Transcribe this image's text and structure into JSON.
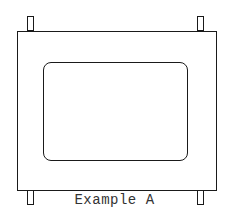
{
  "figure": {
    "caption": "Example A",
    "components": {
      "outer_frame": "rectangular frame",
      "inner_window": "rounded rectangle opening",
      "pins": [
        "top-left",
        "top-right",
        "bottom-left",
        "bottom-right"
      ]
    },
    "colors": {
      "line": "#1a1a1a",
      "background": "#ffffff",
      "text": "#333333"
    }
  }
}
